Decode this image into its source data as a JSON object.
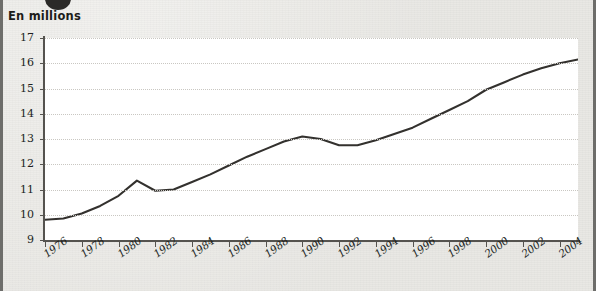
{
  "axis_title": "En millions",
  "bullet_marker": "bullet-dot",
  "chart_data": {
    "type": "line",
    "title": "",
    "subtitle": "",
    "xlabel": "",
    "ylabel": "En millions",
    "ylim": [
      9,
      17
    ],
    "xlim": [
      1976,
      2005
    ],
    "grid": true,
    "legend": "none",
    "line_color": "#33312e",
    "plot_background": "#ffffff",
    "page_background": "#e9e8e4",
    "ytick_labels": [
      "9",
      "10",
      "11",
      "12",
      "13",
      "14",
      "15",
      "16",
      "17"
    ],
    "ytick_values": [
      9,
      10,
      11,
      12,
      13,
      14,
      15,
      16,
      17
    ],
    "xtick_labels": [
      "1976",
      "1978",
      "1980",
      "1982",
      "1984",
      "1986",
      "1988",
      "1990",
      "1992",
      "1994",
      "1996",
      "1998",
      "2000",
      "2002",
      "2004"
    ],
    "xtick_values": [
      1976,
      1978,
      1980,
      1982,
      1984,
      1986,
      1988,
      1990,
      1992,
      1994,
      1996,
      1998,
      2000,
      2002,
      2004
    ],
    "x": [
      1976,
      1977,
      1978,
      1979,
      1980,
      1981,
      1982,
      1983,
      1984,
      1985,
      1986,
      1987,
      1988,
      1989,
      1990,
      1991,
      1992,
      1993,
      1994,
      1995,
      1996,
      1997,
      1998,
      1999,
      2000,
      2001,
      2002,
      2003,
      2004,
      2005
    ],
    "values": [
      9.8,
      9.85,
      10.05,
      10.35,
      10.75,
      11.35,
      10.95,
      11.0,
      11.3,
      11.6,
      11.95,
      12.3,
      12.6,
      12.9,
      13.1,
      13.0,
      12.75,
      12.75,
      12.95,
      13.2,
      13.45,
      13.8,
      14.15,
      14.5,
      14.95,
      15.25,
      15.55,
      15.8,
      16.0,
      16.15
    ],
    "series": [
      {
        "name": "Population",
        "values": [
          9.8,
          9.85,
          10.05,
          10.35,
          10.75,
          11.35,
          10.95,
          11.0,
          11.3,
          11.6,
          11.95,
          12.3,
          12.6,
          12.9,
          13.1,
          13.0,
          12.75,
          12.75,
          12.95,
          13.2,
          13.45,
          13.8,
          14.15,
          14.5,
          14.95,
          15.25,
          15.55,
          15.8,
          16.0,
          16.15
        ]
      }
    ]
  }
}
